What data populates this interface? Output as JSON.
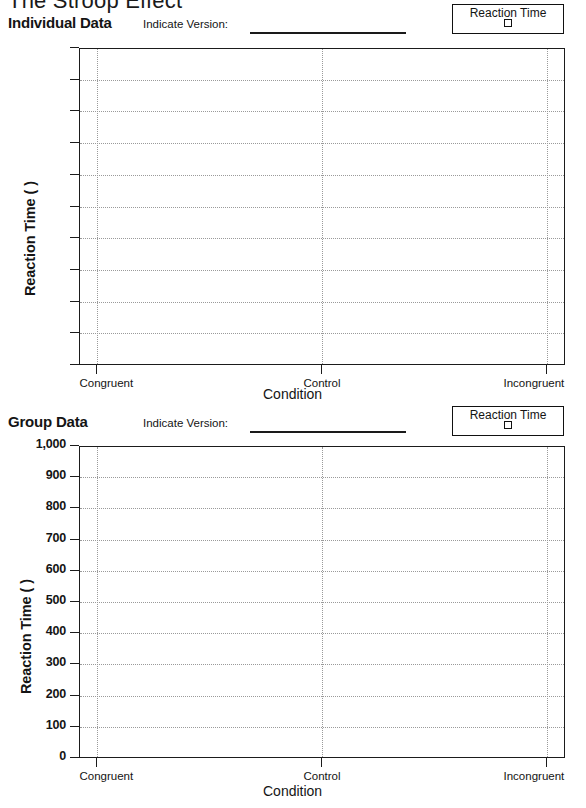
{
  "document": {
    "title": "The Stroop Effect"
  },
  "legend": {
    "label": "Reaction Time",
    "swatch_icon": "empty-square-swatch"
  },
  "version_field": {
    "label": "Indicate Version:",
    "value": ""
  },
  "sections": [
    {
      "id": "individual",
      "title": "Individual Data"
    },
    {
      "id": "group",
      "title": "Group Data"
    }
  ],
  "chart_data": [
    {
      "type": "bar",
      "id": "individual-data-chart",
      "title": "Individual Data",
      "xlabel": "Condition",
      "ylabel": "Reaction Time (  )",
      "categories": [
        "Congruent",
        "Control",
        "Incongruent"
      ],
      "values": [
        null,
        null,
        null
      ],
      "series": [
        {
          "name": "Reaction Time",
          "values": [
            null,
            null,
            null
          ]
        }
      ],
      "ylim": [
        0,
        1000
      ],
      "yticks": [
        0,
        100,
        200,
        300,
        400,
        500,
        600,
        700,
        800,
        900,
        1000
      ],
      "ytick_labels": [
        "",
        "",
        "",
        "",
        "",
        "",
        "",
        "",
        "",
        "",
        ""
      ],
      "grid": true,
      "legend_position": "top-right",
      "note": "blank worksheet grid - no data plotted"
    },
    {
      "type": "bar",
      "id": "group-data-chart",
      "title": "Group Data",
      "xlabel": "Condition",
      "ylabel": "Reaction Time (  )",
      "categories": [
        "Congruent",
        "Control",
        "Incongruent"
      ],
      "values": [
        null,
        null,
        null
      ],
      "series": [
        {
          "name": "Reaction Time",
          "values": [
            null,
            null,
            null
          ]
        }
      ],
      "ylim": [
        0,
        1000
      ],
      "yticks": [
        0,
        100,
        200,
        300,
        400,
        500,
        600,
        700,
        800,
        900,
        1000
      ],
      "ytick_labels": [
        "0",
        "100",
        "200",
        "300",
        "400",
        "500",
        "600",
        "700",
        "800",
        "900",
        "1,000"
      ],
      "grid": true,
      "legend_position": "top-right",
      "note": "blank worksheet grid - no data plotted"
    }
  ],
  "colors": {
    "ink": "#1b1b1b",
    "grid": "#9a9a9a",
    "paper": "#ffffff"
  }
}
